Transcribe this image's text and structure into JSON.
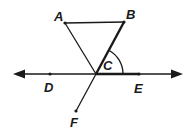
{
  "diagram": {
    "points": {
      "A": {
        "label": "A",
        "x": 65,
        "y": 23
      },
      "B": {
        "label": "B",
        "x": 124,
        "y": 22
      },
      "C": {
        "label": "C",
        "x": 96,
        "y": 74
      },
      "D": {
        "label": "D",
        "x": 50,
        "y": 74
      },
      "E": {
        "label": "E",
        "x": 139,
        "y": 74
      },
      "F": {
        "label": "F",
        "x": 76,
        "y": 111
      }
    },
    "segments": [
      "AB",
      "AC",
      "BC (bold)",
      "CF",
      "CE (bold)"
    ],
    "line": "DE (double-headed arrow)",
    "angle_marked": "BCE",
    "colors": {
      "stroke": "#1a1a1a",
      "background": "#ffffff"
    }
  }
}
